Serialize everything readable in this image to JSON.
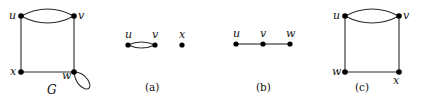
{
  "figure": {
    "graphs": [
      {
        "id": "G",
        "caption": "G",
        "vertices": [
          {
            "name": "u",
            "x": 21,
            "y": 16
          },
          {
            "name": "v",
            "x": 74,
            "y": 16
          },
          {
            "name": "x",
            "x": 21,
            "y": 72
          },
          {
            "name": "w",
            "x": 74,
            "y": 72
          }
        ],
        "edges": [
          [
            "u",
            "v",
            "curve-up"
          ],
          [
            "u",
            "v",
            "curve-down"
          ],
          [
            "u",
            "x"
          ],
          [
            "v",
            "w"
          ],
          [
            "x",
            "w"
          ],
          [
            "w",
            "w",
            "loop"
          ]
        ]
      },
      {
        "id": "a",
        "caption": "(a)",
        "vertices": [
          {
            "name": "u",
            "x": 128,
            "y": 45
          },
          {
            "name": "v",
            "x": 155,
            "y": 45
          },
          {
            "name": "x",
            "x": 182,
            "y": 45
          }
        ],
        "edges": [
          [
            "u",
            "v",
            "curve-up"
          ],
          [
            "u",
            "v",
            "curve-down"
          ]
        ]
      },
      {
        "id": "b",
        "caption": "(b)",
        "vertices": [
          {
            "name": "u",
            "x": 236,
            "y": 44
          },
          {
            "name": "v",
            "x": 263,
            "y": 44
          },
          {
            "name": "w",
            "x": 290,
            "y": 44
          }
        ],
        "edges": [
          [
            "u",
            "v"
          ],
          [
            "v",
            "w"
          ]
        ]
      },
      {
        "id": "c",
        "caption": "(c)",
        "vertices": [
          {
            "name": "u",
            "x": 345,
            "y": 16
          },
          {
            "name": "v",
            "x": 399,
            "y": 16
          },
          {
            "name": "w",
            "x": 345,
            "y": 72
          },
          {
            "name": "x",
            "x": 399,
            "y": 72
          }
        ],
        "edges": [
          [
            "u",
            "v",
            "curve-up"
          ],
          [
            "u",
            "v",
            "curve-down"
          ],
          [
            "u",
            "w"
          ],
          [
            "v",
            "x"
          ],
          [
            "w",
            "x"
          ]
        ]
      }
    ],
    "labels": {
      "G": {
        "u": "u",
        "v": "v",
        "x": "x",
        "w": "w",
        "name": "G"
      },
      "a": {
        "u": "u",
        "v": "v",
        "x": "x",
        "caption": "(a)"
      },
      "b": {
        "u": "u",
        "v": "v",
        "w": "w",
        "caption": "(b)"
      },
      "c": {
        "u": "u",
        "v": "v",
        "w": "w",
        "x": "x",
        "caption": "(c)"
      }
    }
  }
}
